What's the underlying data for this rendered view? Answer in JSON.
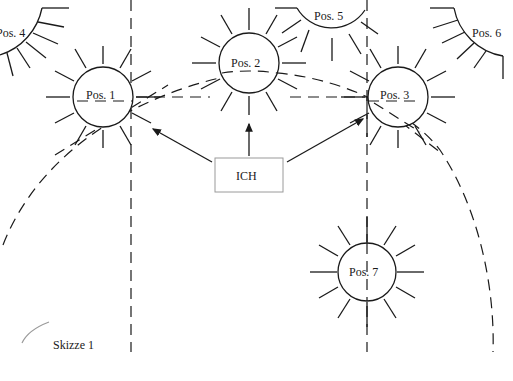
{
  "diagram": {
    "caption": "Skizze 1",
    "center_box": {
      "label": "ICH"
    },
    "positions": [
      {
        "id": "pos1",
        "label": "Pos. 1",
        "cx": 103,
        "cy": 97,
        "r": 30
      },
      {
        "id": "pos2",
        "label": "Pos. 2",
        "cx": 249,
        "cy": 63,
        "r": 30
      },
      {
        "id": "pos3",
        "label": "Pos. 3",
        "cx": 398,
        "cy": 97,
        "r": 30
      },
      {
        "id": "pos4",
        "label": "Pos. 4",
        "partial": true
      },
      {
        "id": "pos5",
        "label": "Pos. 5",
        "partial": true
      },
      {
        "id": "pos6",
        "label": "Pos. 6",
        "partial": true
      },
      {
        "id": "pos7",
        "label": "Pos. 7",
        "cx": 367,
        "cy": 272,
        "r": 29
      }
    ],
    "arrows": [
      {
        "from": "ICH",
        "to": "Pos. 1"
      },
      {
        "from": "ICH",
        "to": "Pos. 2"
      },
      {
        "from": "ICH",
        "to": "Pos. 3"
      }
    ],
    "colors": {
      "stroke": "#1a1a1a",
      "box_border": "#9a9a9a",
      "background": "#ffffff"
    }
  }
}
